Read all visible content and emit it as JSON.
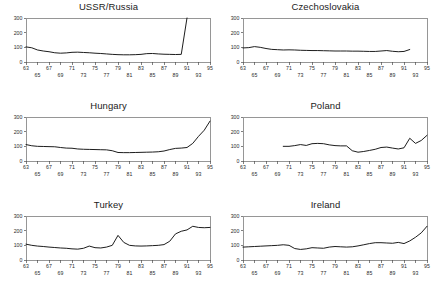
{
  "figure": {
    "layout": "2 columns x 3 rows of small-multiple line charts",
    "background_color": "#ffffff",
    "line_color": "#111111",
    "axis_color": "#4a4a4a"
  },
  "chart_data": [
    {
      "type": "line",
      "title": "USSR/Russia",
      "xlabel": "",
      "ylabel": "",
      "ylim": [
        0,
        300
      ],
      "yticks": [
        0,
        100,
        200,
        300
      ],
      "ytick_labels": [
        "0",
        "100",
        "200",
        "300"
      ],
      "xlim": [
        63,
        95
      ],
      "xticks": [
        63,
        65,
        67,
        69,
        71,
        73,
        75,
        77,
        79,
        81,
        83,
        85,
        87,
        89,
        91,
        93,
        95
      ],
      "xtick_labels_top": [
        "63",
        "67",
        "71",
        "75",
        "79",
        "83",
        "87",
        "91",
        "95"
      ],
      "xtick_labels_bottom": [
        "65",
        "69",
        "73",
        "77",
        "81",
        "85",
        "89",
        "93"
      ],
      "grid": false,
      "legend": "none",
      "x": [
        63,
        64,
        65,
        66,
        67,
        68,
        69,
        70,
        71,
        72,
        73,
        74,
        75,
        76,
        77,
        78,
        79,
        80,
        81,
        82,
        83,
        84,
        85,
        86,
        87,
        88,
        89,
        90,
        91
      ],
      "values": [
        103,
        97,
        82,
        75,
        70,
        63,
        60,
        62,
        66,
        67,
        65,
        63,
        60,
        58,
        55,
        52,
        50,
        49,
        49,
        50,
        52,
        57,
        58,
        55,
        53,
        52,
        51,
        52,
        300
      ]
    },
    {
      "type": "line",
      "title": "Czechoslovakia",
      "xlabel": "",
      "ylabel": "",
      "ylim": [
        0,
        300
      ],
      "yticks": [
        0,
        100,
        200,
        300
      ],
      "ytick_labels": [
        "0",
        "100",
        "200",
        "300"
      ],
      "xlim": [
        63,
        95
      ],
      "xticks": [
        63,
        65,
        67,
        69,
        71,
        73,
        75,
        77,
        79,
        81,
        83,
        85,
        87,
        89,
        91,
        93,
        95
      ],
      "xtick_labels_top": [
        "63",
        "67",
        "71",
        "75",
        "79",
        "83",
        "87",
        "91",
        "95"
      ],
      "xtick_labels_bottom": [
        "65",
        "69",
        "73",
        "77",
        "81",
        "85",
        "89",
        "93"
      ],
      "grid": false,
      "legend": "none",
      "x": [
        63,
        64,
        65,
        66,
        67,
        68,
        69,
        70,
        71,
        72,
        73,
        74,
        75,
        76,
        77,
        78,
        79,
        80,
        81,
        82,
        83,
        84,
        85,
        86,
        87,
        88,
        89,
        90,
        91,
        92
      ],
      "values": [
        96,
        98,
        105,
        100,
        92,
        86,
        84,
        82,
        83,
        82,
        80,
        79,
        78,
        78,
        77,
        76,
        75,
        75,
        75,
        74,
        74,
        73,
        72,
        72,
        75,
        78,
        73,
        70,
        72,
        85
      ]
    },
    {
      "type": "line",
      "title": "Hungary",
      "xlabel": "",
      "ylabel": "",
      "ylim": [
        0,
        300
      ],
      "yticks": [
        0,
        100,
        200,
        300
      ],
      "ytick_labels": [
        "0",
        "100",
        "200",
        "300"
      ],
      "xlim": [
        63,
        95
      ],
      "xticks": [
        63,
        65,
        67,
        69,
        71,
        73,
        75,
        77,
        79,
        81,
        83,
        85,
        87,
        89,
        91,
        93,
        95
      ],
      "xtick_labels_top": [
        "63",
        "67",
        "71",
        "75",
        "79",
        "83",
        "87",
        "91",
        "95"
      ],
      "xtick_labels_bottom": [
        "65",
        "69",
        "73",
        "77",
        "81",
        "85",
        "89",
        "93"
      ],
      "grid": false,
      "legend": "none",
      "x": [
        63,
        64,
        65,
        66,
        67,
        68,
        69,
        70,
        71,
        72,
        73,
        74,
        75,
        76,
        77,
        78,
        79,
        80,
        81,
        82,
        83,
        84,
        85,
        86,
        87,
        88,
        89,
        90,
        91,
        92,
        93,
        94,
        95
      ],
      "values": [
        112,
        104,
        100,
        99,
        98,
        97,
        92,
        88,
        87,
        82,
        80,
        79,
        78,
        77,
        76,
        70,
        58,
        57,
        57,
        58,
        59,
        60,
        61,
        63,
        68,
        78,
        86,
        88,
        92,
        120,
        168,
        210,
        272
      ]
    },
    {
      "type": "line",
      "title": "Poland",
      "xlabel": "",
      "ylabel": "",
      "ylim": [
        0,
        300
      ],
      "yticks": [
        0,
        100,
        200,
        300
      ],
      "ytick_labels": [
        "0",
        "100",
        "200",
        "300"
      ],
      "xlim": [
        63,
        95
      ],
      "xticks": [
        63,
        65,
        67,
        69,
        71,
        73,
        75,
        77,
        79,
        81,
        83,
        85,
        87,
        89,
        91,
        93,
        95
      ],
      "xtick_labels_top": [
        "63",
        "67",
        "71",
        "75",
        "79",
        "83",
        "87",
        "91",
        "95"
      ],
      "xtick_labels_bottom": [
        "65",
        "69",
        "73",
        "77",
        "81",
        "85",
        "89",
        "93"
      ],
      "grid": false,
      "legend": "none",
      "x": [
        70,
        71,
        72,
        73,
        74,
        75,
        76,
        77,
        78,
        79,
        80,
        81,
        82,
        83,
        84,
        85,
        86,
        87,
        88,
        89,
        90,
        91,
        92,
        93,
        94,
        95
      ],
      "values": [
        100,
        100,
        105,
        112,
        106,
        118,
        120,
        118,
        110,
        105,
        103,
        103,
        70,
        60,
        65,
        72,
        80,
        92,
        95,
        88,
        82,
        90,
        155,
        120,
        140,
        175
      ]
    },
    {
      "type": "line",
      "title": "Turkey",
      "xlabel": "",
      "ylabel": "",
      "ylim": [
        0,
        300
      ],
      "yticks": [
        0,
        100,
        200,
        300
      ],
      "ytick_labels": [
        "0",
        "100",
        "200",
        "300"
      ],
      "xlim": [
        63,
        95
      ],
      "xticks": [
        63,
        65,
        67,
        69,
        71,
        73,
        75,
        77,
        79,
        81,
        83,
        85,
        87,
        89,
        91,
        93,
        95
      ],
      "xtick_labels_top": [
        "63",
        "67",
        "71",
        "75",
        "79",
        "83",
        "87",
        "91",
        "95"
      ],
      "xtick_labels_bottom": [
        "65",
        "69",
        "73",
        "77",
        "81",
        "85",
        "89",
        "93"
      ],
      "grid": false,
      "legend": "none",
      "x": [
        63,
        64,
        65,
        66,
        67,
        68,
        69,
        70,
        71,
        72,
        73,
        74,
        75,
        76,
        77,
        78,
        79,
        80,
        81,
        82,
        83,
        84,
        85,
        86,
        87,
        88,
        89,
        90,
        91,
        92,
        93,
        94,
        95
      ],
      "values": [
        108,
        100,
        95,
        92,
        88,
        85,
        82,
        80,
        76,
        74,
        80,
        95,
        84,
        82,
        88,
        100,
        168,
        120,
        100,
        96,
        95,
        96,
        98,
        100,
        105,
        128,
        178,
        196,
        205,
        230,
        222,
        220,
        222
      ]
    },
    {
      "type": "line",
      "title": "Ireland",
      "xlabel": "",
      "ylabel": "",
      "ylim": [
        0,
        300
      ],
      "yticks": [
        0,
        100,
        200,
        300
      ],
      "ytick_labels": [
        "0",
        "100",
        "200",
        "300"
      ],
      "xlim": [
        63,
        95
      ],
      "xticks": [
        63,
        65,
        67,
        69,
        71,
        73,
        75,
        77,
        79,
        81,
        83,
        85,
        87,
        89,
        91,
        93,
        95
      ],
      "xtick_labels_top": [
        "63",
        "67",
        "71",
        "75",
        "79",
        "83",
        "87",
        "91",
        "95"
      ],
      "xtick_labels_bottom": [
        "65",
        "69",
        "73",
        "77",
        "81",
        "85",
        "89",
        "93"
      ],
      "grid": false,
      "legend": "none",
      "x": [
        63,
        64,
        65,
        66,
        67,
        68,
        69,
        70,
        71,
        72,
        73,
        74,
        75,
        76,
        77,
        78,
        79,
        80,
        81,
        82,
        83,
        84,
        85,
        86,
        87,
        88,
        89,
        90,
        91,
        92,
        93,
        94,
        95
      ],
      "values": [
        88,
        90,
        92,
        94,
        96,
        98,
        100,
        104,
        100,
        78,
        72,
        76,
        84,
        82,
        80,
        88,
        92,
        90,
        88,
        90,
        96,
        104,
        112,
        118,
        118,
        116,
        114,
        120,
        112,
        130,
        155,
        185,
        230
      ]
    }
  ]
}
